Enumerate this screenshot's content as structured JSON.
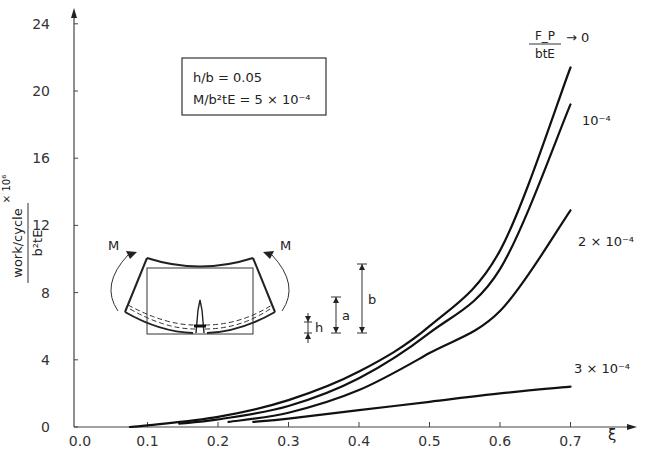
{
  "chart_data": {
    "type": "line",
    "title": "",
    "xlabel": "ξ",
    "ylabel": "work/cycle / b²tE × 10⁶",
    "ylabel_parts": {
      "numerator": "work/cycle",
      "denominator": "b²tE",
      "multiplier": "× 10⁶"
    },
    "xlim": [
      0.0,
      0.75
    ],
    "ylim": [
      0,
      24
    ],
    "x_ticks": [
      "0.0",
      "0.1",
      "0.2",
      "0.3",
      "0.4",
      "0.5",
      "0.6",
      "0.7"
    ],
    "y_ticks": [
      "0",
      "4",
      "8",
      "12",
      "16",
      "20",
      "24"
    ],
    "grid": false,
    "parameter_label": {
      "numerator": "F_P",
      "denominator": "btE"
    },
    "annotation_box": [
      "h/b = 0.05",
      "M/b²tE = 5 × 10⁻⁴"
    ],
    "series": [
      {
        "name": "F_P/btE → 0",
        "label": "→ 0",
        "x": [
          0.075,
          0.1,
          0.2,
          0.3,
          0.4,
          0.5,
          0.6,
          0.7
        ],
        "y": [
          0.0,
          0.1,
          0.6,
          1.6,
          3.3,
          6.0,
          10.5,
          21.4
        ]
      },
      {
        "name": "10⁻⁴",
        "label": "10⁻⁴",
        "x": [
          0.145,
          0.2,
          0.3,
          0.4,
          0.5,
          0.6,
          0.7
        ],
        "y": [
          0.2,
          0.45,
          1.25,
          2.9,
          5.6,
          9.4,
          19.2
        ]
      },
      {
        "name": "2 × 10⁻⁴",
        "label": "2 × 10⁻⁴",
        "x": [
          0.215,
          0.3,
          0.4,
          0.5,
          0.6,
          0.7
        ],
        "y": [
          0.3,
          0.85,
          2.2,
          4.4,
          6.9,
          12.9
        ]
      },
      {
        "name": "3 × 10⁻⁴",
        "label": "3 × 10⁻⁴",
        "x": [
          0.25,
          0.3,
          0.4,
          0.5,
          0.6,
          0.7
        ],
        "y": [
          0.3,
          0.5,
          1.0,
          1.5,
          2.0,
          2.4
        ]
      }
    ],
    "inset_diagram": {
      "description": "Bent beam specimen with crack under moment M",
      "labels": [
        "M",
        "M",
        "h",
        "a",
        "b"
      ]
    }
  }
}
